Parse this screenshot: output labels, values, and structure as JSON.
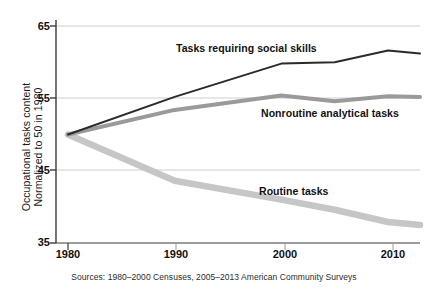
{
  "chart_data": {
    "type": "line",
    "title": "",
    "subtitle": "",
    "xlabel": "",
    "ylabel": "Occupational tasks content Normalized to 50 in 1980",
    "ylabel_lines": [
      "Occupational tasks content",
      "Normalized to 50 in 1980"
    ],
    "xlim": [
      1980,
      2013
    ],
    "ylim": [
      35,
      65
    ],
    "grid": true,
    "grid_axis": "y",
    "legend_position": "inline-annotations",
    "x_ticks": [
      1980,
      1990,
      2000,
      2010
    ],
    "x_tick_labels": [
      "1980",
      "1990",
      "2000",
      "2010"
    ],
    "y_ticks": [
      35,
      45,
      55,
      65
    ],
    "y_tick_labels": [
      "35",
      "45",
      "55",
      "65"
    ],
    "x": [
      1980,
      1990,
      2000,
      2005,
      2010,
      2013
    ],
    "series": [
      {
        "name": "Tasks requiring social skills",
        "color": "#2b2b2b",
        "width": 2.0,
        "values": [
          50.0,
          55.2,
          59.8,
          60.0,
          61.6,
          61.2
        ],
        "label_x": 2000,
        "label_y": 63.0
      },
      {
        "name": "Nonroutine analytical tasks",
        "color": "#9a9a9a",
        "width": 4.0,
        "values": [
          50.0,
          53.4,
          55.4,
          54.6,
          55.3,
          55.2
        ],
        "label_x": 2008,
        "label_y": 52.3
      },
      {
        "name": "Routine tasks",
        "color": "#c6c6c6",
        "width": 6.5,
        "values": [
          50.0,
          43.6,
          41.0,
          39.6,
          37.9,
          37.5
        ],
        "label_x": 2003,
        "label_y": 43.2
      }
    ],
    "annotations": [
      {
        "name": "source-note",
        "text": "Sources: 1980–2000 Censuses, 2005–2013 American Community Surveys"
      }
    ],
    "axis_color": "#444444",
    "gridline_color": "#cfcfcf",
    "background": "#ffffff"
  },
  "labels": {
    "y_title_line1": "Occupational tasks content",
    "y_title_line2": "Normalized to 50 in 1980",
    "ytick_65": "65",
    "ytick_55": "55",
    "ytick_45": "45",
    "ytick_35": "35",
    "xtick_1980": "1980",
    "xtick_1990": "1990",
    "xtick_2000": "2000",
    "xtick_2010": "2010",
    "series_social": "Tasks requiring social skills",
    "series_analytical": "Nonroutine analytical tasks",
    "series_routine": "Routine tasks",
    "source": "Sources: 1980–2000 Censuses, 2005–2013 American Community Surveys"
  }
}
